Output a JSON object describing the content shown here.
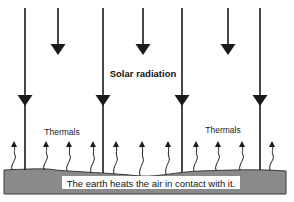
{
  "diagram": {
    "title_label": "Solar radiation",
    "thermals_labels": [
      "Thermals",
      "Thermals"
    ],
    "caption": "The earth heats the air in contact with it.",
    "colors": {
      "arrow": "#1a1a1a",
      "ground": "#8a8a8a",
      "ground_edge": "#3a3a3a",
      "caption_bg": "#ffffff",
      "text": "#111111"
    },
    "solar_arrows": [
      {
        "kind": "long"
      },
      {
        "kind": "short"
      },
      {
        "kind": "long"
      },
      {
        "kind": "short"
      },
      {
        "kind": "long"
      },
      {
        "kind": "short"
      },
      {
        "kind": "long"
      }
    ],
    "thermal_count": 11
  }
}
